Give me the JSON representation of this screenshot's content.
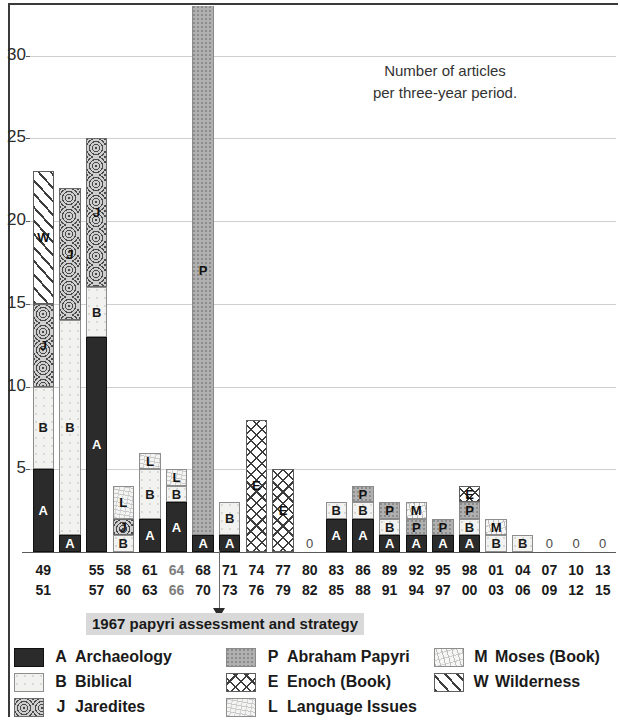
{
  "chart_data": {
    "type": "bar",
    "subtype": "stacked-bar",
    "title_lines": [
      "Number of articles",
      "per three-year period."
    ],
    "xlabel": "",
    "ylabel": "",
    "ylim": [
      0,
      33
    ],
    "yticks": [
      5,
      10,
      15,
      20,
      25,
      30
    ],
    "grid": true,
    "legend_position": "below-plot",
    "categories": [
      "49-51",
      "52-54",
      "55-57",
      "58-60",
      "61-63",
      "64-66",
      "68-70",
      "71-73",
      "74-76",
      "77-79",
      "80-82",
      "83-85",
      "86-88",
      "89-91",
      "92-94",
      "95-97",
      "98-00",
      "01-03",
      "04-06",
      "07-09",
      "10-12",
      "13-15"
    ],
    "series": [
      {
        "name": "A",
        "label": "Archaeology",
        "values": [
          5,
          1,
          13,
          0,
          2,
          3,
          1,
          1,
          0,
          0,
          0,
          2,
          2,
          1,
          1,
          1,
          1,
          0,
          0,
          0,
          0,
          0
        ]
      },
      {
        "name": "B",
        "label": "Biblical",
        "values": [
          5,
          13,
          3,
          1,
          3,
          1,
          0,
          2,
          0,
          0,
          0,
          1,
          1,
          1,
          0,
          0,
          1,
          1,
          1,
          0,
          0,
          0
        ]
      },
      {
        "name": "J",
        "label": "Jaredites",
        "values": [
          5,
          8,
          9,
          1,
          0,
          0,
          0,
          0,
          0,
          0,
          0,
          0,
          0,
          0,
          0,
          0,
          0,
          0,
          0,
          0,
          0,
          0
        ]
      },
      {
        "name": "W",
        "label": "Wilderness",
        "values": [
          8,
          0,
          0,
          0,
          0,
          0,
          0,
          0,
          0,
          0,
          0,
          0,
          0,
          0,
          0,
          0,
          0,
          0,
          0,
          0,
          0,
          0
        ]
      },
      {
        "name": "L",
        "label": "Language Issues",
        "values": [
          0,
          0,
          0,
          2,
          1,
          1,
          0,
          0,
          0,
          0,
          0,
          0,
          0,
          0,
          0,
          0,
          0,
          0,
          0,
          0,
          0,
          0
        ]
      },
      {
        "name": "P",
        "label": "Abraham Papyri",
        "values": [
          0,
          0,
          0,
          0,
          0,
          0,
          32,
          0,
          0,
          0,
          0,
          0,
          1,
          1,
          1,
          1,
          1,
          0,
          0,
          0,
          0,
          0
        ]
      },
      {
        "name": "E",
        "label": "Enoch (Book)",
        "values": [
          0,
          0,
          0,
          0,
          0,
          0,
          0,
          0,
          8,
          5,
          0,
          0,
          0,
          0,
          0,
          0,
          1,
          0,
          0,
          0,
          0,
          0
        ]
      },
      {
        "name": "M",
        "label": "Moses (Book)",
        "values": [
          0,
          0,
          0,
          0,
          0,
          0,
          0,
          0,
          0,
          0,
          0,
          0,
          0,
          0,
          1,
          0,
          0,
          1,
          0,
          0,
          0,
          0
        ]
      }
    ],
    "totals": [
      23,
      22,
      25,
      4,
      6,
      5,
      33,
      3,
      8,
      5,
      0,
      3,
      3,
      3,
      3,
      3,
      4,
      2,
      1,
      0,
      0,
      0
    ],
    "clipped_bars": [
      "68-70"
    ],
    "zero_categories": [
      "80-82",
      "07-09",
      "10-12",
      "13-15"
    ],
    "annotation": {
      "text": "1967 papyri assessment and strategy",
      "points_to": "68-70"
    }
  },
  "axis": {
    "y_tick_labels": [
      "30",
      "25",
      "20",
      "15",
      "10",
      "5"
    ],
    "x_labels": [
      {
        "start": "49",
        "end": "51",
        "faded": false
      },
      {
        "start": "",
        "end": "",
        "faded": false
      },
      {
        "start": "55",
        "end": "57",
        "faded": false
      },
      {
        "start": "58",
        "end": "60",
        "faded": false
      },
      {
        "start": "61",
        "end": "63",
        "faded": false
      },
      {
        "start": "64",
        "end": "66",
        "faded": true
      },
      {
        "start": "68",
        "end": "70",
        "faded": false
      },
      {
        "start": "71",
        "end": "73",
        "faded": false
      },
      {
        "start": "74",
        "end": "76",
        "faded": false
      },
      {
        "start": "77",
        "end": "79",
        "faded": false
      },
      {
        "start": "80",
        "end": "82",
        "faded": false
      },
      {
        "start": "83",
        "end": "85",
        "faded": false
      },
      {
        "start": "86",
        "end": "88",
        "faded": false
      },
      {
        "start": "89",
        "end": "91",
        "faded": false
      },
      {
        "start": "92",
        "end": "94",
        "faded": false
      },
      {
        "start": "95",
        "end": "97",
        "faded": false
      },
      {
        "start": "98",
        "end": "00",
        "faded": false
      },
      {
        "start": "01",
        "end": "03",
        "faded": false
      },
      {
        "start": "04",
        "end": "06",
        "faded": false
      },
      {
        "start": "07",
        "end": "09",
        "faded": false
      },
      {
        "start": "10",
        "end": "12",
        "faded": false
      },
      {
        "start": "13",
        "end": "15",
        "faded": false
      }
    ]
  },
  "legend": {
    "columns": [
      [
        {
          "key": "A",
          "label": "Archaeology",
          "fill": "A"
        },
        {
          "key": "B",
          "label": "Biblical",
          "fill": "B"
        },
        {
          "key": "J",
          "label": "Jaredites",
          "fill": "J"
        }
      ],
      [
        {
          "key": "P",
          "label": "Abraham Papyri",
          "fill": "P"
        },
        {
          "key": "E",
          "label": "Enoch (Book)",
          "fill": "E"
        },
        {
          "key": "L",
          "label": "Language Issues",
          "fill": "L"
        }
      ],
      [
        {
          "key": "M",
          "label": "Moses (Book)",
          "fill": "M"
        },
        {
          "key": "W",
          "label": "Wilderness",
          "fill": "W"
        }
      ]
    ]
  },
  "colors": {
    "archaeology": "#2b2b2b",
    "biblical": "#f2f2f0",
    "jaredites": "#9a9a9a",
    "papyri": "#b0b0b0",
    "annotation_bg": "#d9d9d9",
    "grid": "#cfcfcf",
    "axis": "#5a5a5a"
  }
}
